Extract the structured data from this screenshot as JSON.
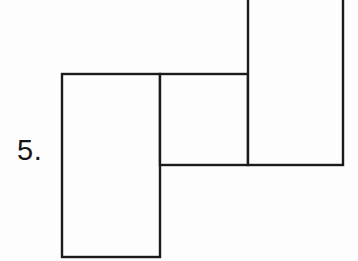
{
  "page": {
    "background_color": "#fdfdfd",
    "line_color": "#1b1b1b",
    "width": 358,
    "height": 261
  },
  "problem": {
    "number_label": "5."
  },
  "figure": {
    "name": "three-overlapping-rectangles",
    "stroke_width": 2.4,
    "rectangles": [
      {
        "name": "left-rectangle",
        "x": 62,
        "y": 74,
        "width": 98,
        "height": 183
      },
      {
        "name": "middle-rectangle",
        "x": 160,
        "y": 74,
        "width": 88,
        "height": 91
      },
      {
        "name": "right-rectangle",
        "x": 248,
        "y": -28,
        "width": 95,
        "height": 193
      }
    ]
  }
}
